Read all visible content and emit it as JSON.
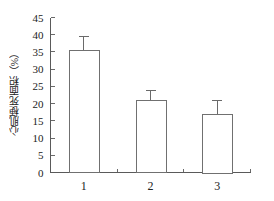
{
  "chart_data": {
    "type": "bar",
    "title": "",
    "xlabel": "",
    "ylabel": "心肌梗死面积（%）",
    "categories": [
      "1",
      "2",
      "3"
    ],
    "values": [
      35.5,
      21.0,
      17.0
    ],
    "errors": [
      4.0,
      2.7,
      3.8
    ],
    "error_type": "symmetric-upper-cap",
    "ylim": [
      0,
      45
    ],
    "ytick_labels": [
      "0",
      "5",
      "10",
      "15",
      "20",
      "25",
      "30",
      "35",
      "40",
      "45"
    ],
    "ytick_values": [
      0,
      5,
      10,
      15,
      20,
      25,
      30,
      35,
      40,
      45
    ],
    "grid": false,
    "legend": null,
    "legend_position": "none",
    "bar_fill_color": "#ffffff",
    "bar_edge_color": "#707070",
    "axis_color": "#5a5a5a",
    "background_color": "#ffffff",
    "series": [
      {
        "name": "心肌梗死面积",
        "values": [
          35.5,
          21.0,
          17.0
        ],
        "errors": [
          4.0,
          2.7,
          3.8
        ]
      }
    ]
  },
  "axes": {
    "y_axis_name": "y-axis",
    "x_axis_name": "x-axis"
  }
}
